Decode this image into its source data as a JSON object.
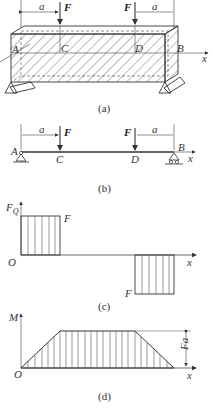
{
  "figure_a": {
    "caption": "(a)",
    "labels": {
      "A": "A",
      "B": "B",
      "C": "C",
      "D": "D",
      "x": "x",
      "F_left": "F",
      "F_right": "F",
      "a_left": "a",
      "a_right": "a"
    }
  },
  "figure_b": {
    "caption": "(b)",
    "labels": {
      "A": "A",
      "B": "B",
      "C": "C",
      "D": "D",
      "x": "x",
      "F_left": "F",
      "F_right": "F",
      "a_left": "a",
      "a_right": "a"
    }
  },
  "figure_c": {
    "caption": "(c)",
    "y_axis": "F",
    "y_axis_sub": "Q",
    "origin": "O",
    "x_axis": "x",
    "upper_value": "F",
    "lower_value": "F"
  },
  "figure_d": {
    "caption": "(d)",
    "y_axis": "M",
    "origin": "O",
    "x_axis": "x",
    "max_value": "Fa"
  },
  "colors": {
    "line": "#333333",
    "hatch": "#555555",
    "background": "#ffffff"
  }
}
